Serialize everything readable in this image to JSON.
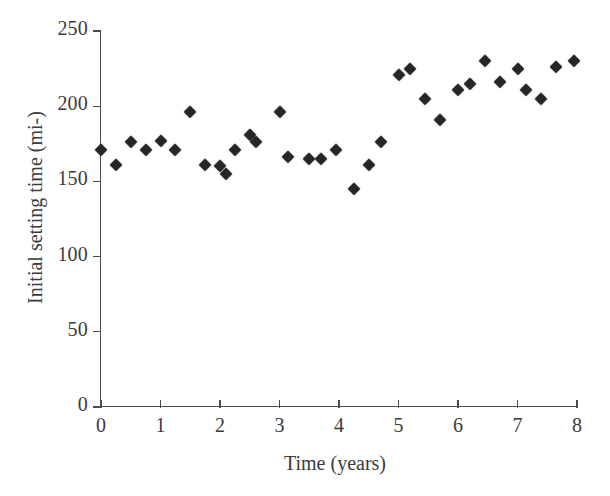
{
  "chart_data": {
    "type": "scatter",
    "title": "",
    "xlabel": "Time (years)",
    "ylabel": "Initial setting time (mi-)",
    "xlim": [
      0,
      8
    ],
    "ylim": [
      0,
      250
    ],
    "xticks": [
      0,
      1,
      2,
      3,
      4,
      5,
      6,
      7,
      8
    ],
    "yticks": [
      0,
      50,
      100,
      150,
      200,
      250
    ],
    "grid": false,
    "legend": false,
    "marker": "filled-diamond",
    "marker_color": "#262626",
    "axis_color": "#4c4c4c",
    "background": "#ffffff",
    "points": [
      {
        "x": 0.0,
        "y": 171
      },
      {
        "x": 0.25,
        "y": 161
      },
      {
        "x": 0.5,
        "y": 176
      },
      {
        "x": 0.75,
        "y": 171
      },
      {
        "x": 1.0,
        "y": 177
      },
      {
        "x": 1.25,
        "y": 171
      },
      {
        "x": 1.5,
        "y": 196
      },
      {
        "x": 1.75,
        "y": 161
      },
      {
        "x": 2.0,
        "y": 160
      },
      {
        "x": 2.1,
        "y": 155
      },
      {
        "x": 2.25,
        "y": 171
      },
      {
        "x": 2.5,
        "y": 181
      },
      {
        "x": 2.6,
        "y": 176
      },
      {
        "x": 3.0,
        "y": 196
      },
      {
        "x": 3.15,
        "y": 166
      },
      {
        "x": 3.5,
        "y": 165
      },
      {
        "x": 3.7,
        "y": 165
      },
      {
        "x": 3.95,
        "y": 171
      },
      {
        "x": 4.25,
        "y": 145
      },
      {
        "x": 4.5,
        "y": 161
      },
      {
        "x": 4.7,
        "y": 176
      },
      {
        "x": 5.0,
        "y": 221
      },
      {
        "x": 5.2,
        "y": 225
      },
      {
        "x": 5.45,
        "y": 205
      },
      {
        "x": 5.7,
        "y": 191
      },
      {
        "x": 6.0,
        "y": 211
      },
      {
        "x": 6.2,
        "y": 215
      },
      {
        "x": 6.45,
        "y": 230
      },
      {
        "x": 6.7,
        "y": 216
      },
      {
        "x": 7.0,
        "y": 225
      },
      {
        "x": 7.15,
        "y": 211
      },
      {
        "x": 7.4,
        "y": 205
      },
      {
        "x": 7.65,
        "y": 226
      },
      {
        "x": 7.95,
        "y": 230
      }
    ]
  }
}
